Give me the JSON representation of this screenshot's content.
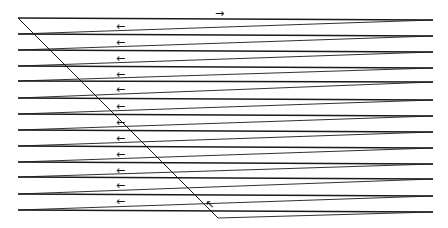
{
  "diagram": {
    "type": "zigzag-path",
    "stroke_color": "#1a1a1a",
    "left_x": 18,
    "right_x": 433,
    "left_y": [
      18,
      34,
      50,
      66,
      81,
      98,
      114,
      130,
      146,
      162,
      177,
      194,
      210
    ],
    "right_y": [
      20,
      36,
      52,
      68,
      82,
      100,
      116,
      132,
      148,
      164,
      179,
      196,
      212
    ],
    "diagonal": {
      "x1": 18,
      "y1": 18,
      "x2": 218,
      "y2": 218
    },
    "bottom_segment": {
      "x1": 218,
      "y1": 218,
      "x2": 433,
      "y2": 212
    },
    "top_arrow": {
      "glyph": "→",
      "x": 215,
      "y": 8,
      "icon": "arrow-right-icon"
    },
    "left_arrows": {
      "glyph": "←",
      "icon": "arrow-left-icon",
      "x": 116,
      "y": [
        27,
        43,
        59,
        75,
        90,
        107,
        123,
        139,
        155,
        171,
        186,
        202
      ]
    },
    "corner_arrow": {
      "glyph": "↖",
      "x": 205,
      "y": 199,
      "icon": "arrow-up-left-icon"
    }
  }
}
